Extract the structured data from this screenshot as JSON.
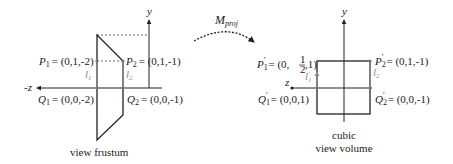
{
  "left_diagram": {
    "axis_y_label": "y",
    "axis_z_label": "-z",
    "p1": {
      "name": "P",
      "sub": "1",
      "value": "= (0,1,-2)"
    },
    "p2": {
      "name": "P",
      "sub": "2",
      "value": "= (0,1,-1)"
    },
    "q1": {
      "name": "Q",
      "sub": "1",
      "value": "= (0,0,-2)"
    },
    "q2": {
      "name": "Q",
      "sub": "2",
      "value": "= (0,0,-1)"
    },
    "l1": {
      "name": "l",
      "sub": "1"
    },
    "l2": {
      "name": "l",
      "sub": "2"
    },
    "caption": "view frustum"
  },
  "transform": {
    "name": "M",
    "sub": "proj"
  },
  "right_diagram": {
    "axis_y_label": "y",
    "axis_z_label": "z",
    "p1": {
      "name": "P",
      "sub": "1",
      "prime": "′",
      "value_prefix": "= (0,",
      "frac_num": "1",
      "frac_den": "2",
      "value_suffix": ",1)"
    },
    "p2": {
      "name": "P",
      "sub": "2",
      "prime": "′",
      "value": "= (0,1,-1)"
    },
    "q1": {
      "name": "Q",
      "sub": "1",
      "prime": "′",
      "value": "= (0,0,1)"
    },
    "q2": {
      "name": "Q",
      "sub": "2",
      "prime": "′",
      "value": "= (0,0,-1)"
    },
    "l1": {
      "name": "l",
      "sub": "1",
      "prime": "′"
    },
    "l2": {
      "name": "l",
      "sub": "2",
      "prime": "′"
    },
    "caption_line1": "cubic",
    "caption_line2": "view volume"
  },
  "colors": {
    "line": "#222222",
    "secondary": "#8a8a8a"
  }
}
